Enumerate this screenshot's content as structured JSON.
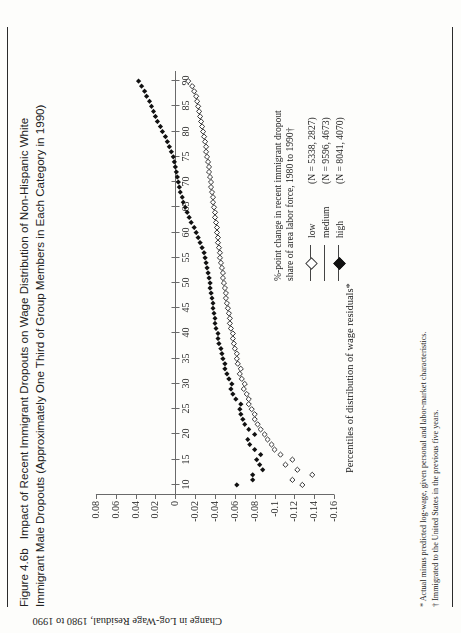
{
  "figure": {
    "number": "Figure 4.6b",
    "title": "Impact of Recent Immigrant Dropouts on Wage Distribution of Non-Hispanic White Immigrant Male Dropouts (Approximately One Third of Group Members in Each Category in 1990)"
  },
  "notes": [
    "* Actual minus predicted log-wage, given personal and labor-market characteristics.",
    "† Immigrated to the United States in the previous five years."
  ],
  "legend": {
    "header_line1": "%-point change in recent immigrant dropout",
    "header_line2": "share of area labor force, 1980 to 1990†",
    "entries": [
      {
        "label": "low",
        "n": "(N = 5338, 2827)",
        "marker": "open"
      },
      {
        "label": "medium",
        "n": "(N = 9596, 4673)",
        "marker": "none"
      },
      {
        "label": "high",
        "n": "(N = 8041, 4070)",
        "marker": "solid"
      }
    ]
  },
  "chart_data": {
    "type": "scatter",
    "title": "",
    "xlabel": "Percentiles of distribution of wage residuals*",
    "ylabel": "Change in Log-Wage Residual, 1980 to 1990",
    "xlim": [
      8,
      92
    ],
    "ylim": [
      -0.17,
      0.09
    ],
    "xticks": [
      10,
      15,
      20,
      25,
      30,
      35,
      40,
      45,
      50,
      55,
      60,
      65,
      70,
      75,
      80,
      85,
      90
    ],
    "yticks": [
      0.08,
      0.06,
      0.04,
      0.02,
      0,
      -0.02,
      -0.04,
      -0.06,
      -0.08,
      -0.1,
      -0.12,
      -0.14,
      -0.16
    ],
    "yticklabels": [
      "0.08",
      "0.06",
      "0.04",
      "0.02",
      "0",
      "-0.02",
      "-0.04",
      "-0.06",
      "-0.08",
      "-0.1",
      "-0.12",
      "-0.14",
      "-0.16"
    ],
    "grid": false,
    "legend_position": "right",
    "x": [
      10,
      11,
      12,
      13,
      14,
      15,
      16,
      17,
      18,
      19,
      20,
      21,
      22,
      23,
      24,
      25,
      26,
      27,
      28,
      29,
      30,
      31,
      32,
      33,
      34,
      35,
      36,
      37,
      38,
      39,
      40,
      41,
      42,
      43,
      44,
      45,
      46,
      47,
      48,
      49,
      50,
      51,
      52,
      53,
      54,
      55,
      56,
      57,
      58,
      59,
      60,
      61,
      62,
      63,
      64,
      65,
      66,
      67,
      68,
      69,
      70,
      71,
      72,
      73,
      74,
      75,
      76,
      77,
      78,
      79,
      80,
      81,
      82,
      83,
      84,
      85,
      86,
      87,
      88,
      89,
      90
    ],
    "series": [
      {
        "name": "low",
        "marker": "open-diamond",
        "values": [
          -0.128,
          -0.118,
          -0.138,
          -0.123,
          -0.111,
          -0.118,
          -0.106,
          -0.1,
          -0.097,
          -0.093,
          -0.09,
          -0.086,
          -0.083,
          -0.08,
          -0.08,
          -0.077,
          -0.074,
          -0.074,
          -0.072,
          -0.069,
          -0.07,
          -0.067,
          -0.065,
          -0.066,
          -0.063,
          -0.062,
          -0.062,
          -0.06,
          -0.059,
          -0.058,
          -0.058,
          -0.056,
          -0.055,
          -0.055,
          -0.054,
          -0.053,
          -0.052,
          -0.051,
          -0.051,
          -0.05,
          -0.049,
          -0.048,
          -0.048,
          -0.047,
          -0.046,
          -0.045,
          -0.045,
          -0.044,
          -0.043,
          -0.043,
          -0.042,
          -0.042,
          -0.041,
          -0.04,
          -0.04,
          -0.039,
          -0.038,
          -0.038,
          -0.037,
          -0.036,
          -0.036,
          -0.035,
          -0.034,
          -0.034,
          -0.033,
          -0.032,
          -0.031,
          -0.031,
          -0.03,
          -0.029,
          -0.028,
          -0.027,
          -0.026,
          -0.025,
          -0.024,
          -0.023,
          -0.022,
          -0.021,
          -0.019,
          -0.017,
          -0.013
        ]
      },
      {
        "name": "high",
        "marker": "solid-diamond",
        "values": [
          -0.062,
          -0.078,
          -0.078,
          -0.088,
          -0.085,
          -0.082,
          -0.086,
          -0.08,
          -0.075,
          -0.073,
          -0.08,
          -0.074,
          -0.07,
          -0.068,
          -0.066,
          -0.065,
          -0.066,
          -0.061,
          -0.058,
          -0.056,
          -0.057,
          -0.054,
          -0.052,
          -0.05,
          -0.05,
          -0.048,
          -0.047,
          -0.046,
          -0.044,
          -0.043,
          -0.043,
          -0.041,
          -0.04,
          -0.04,
          -0.039,
          -0.038,
          -0.038,
          -0.037,
          -0.036,
          -0.035,
          -0.035,
          -0.034,
          -0.033,
          -0.032,
          -0.031,
          -0.03,
          -0.029,
          -0.027,
          -0.025,
          -0.023,
          -0.021,
          -0.019,
          -0.016,
          -0.014,
          -0.012,
          -0.01,
          -0.008,
          -0.007,
          -0.005,
          -0.004,
          -0.003,
          -0.002,
          -0.001,
          0.0,
          0.001,
          0.002,
          0.004,
          0.006,
          0.008,
          0.01,
          0.013,
          0.015,
          0.018,
          0.02,
          0.022,
          0.024,
          0.026,
          0.029,
          0.031,
          0.034,
          0.037
        ]
      }
    ]
  }
}
